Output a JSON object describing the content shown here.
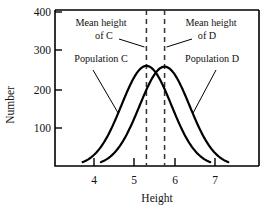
{
  "chart_data": {
    "type": "line",
    "title": "",
    "xlabel": "Height",
    "ylabel": "Number",
    "xlim": [
      3.3,
      7.6
    ],
    "ylim": [
      0,
      400
    ],
    "grid": false,
    "legend": "none",
    "x_ticks": [
      "4",
      "5",
      "6",
      "7"
    ],
    "x_tick_values": [
      4,
      5,
      6,
      7
    ],
    "y_ticks": [
      "100",
      "200",
      "300",
      "400"
    ],
    "y_tick_values": [
      100,
      200,
      300,
      400
    ],
    "series": [
      {
        "name": "Population C",
        "mean": 5.3,
        "sd": 0.62,
        "peak": 260,
        "x": [
          3.7,
          3.9,
          4.1,
          4.3,
          4.5,
          4.7,
          4.9,
          5.1,
          5.3,
          5.5,
          5.7,
          5.9,
          6.1,
          6.3,
          6.5,
          6.7,
          6.9
        ],
        "values": [
          4,
          10,
          24,
          48,
          85,
          132,
          183,
          229,
          258,
          251,
          215,
          166,
          115,
          70,
          38,
          18,
          7
        ]
      },
      {
        "name": "Population D",
        "mean": 5.75,
        "sd": 0.62,
        "peak": 258,
        "x": [
          4.15,
          4.35,
          4.55,
          4.75,
          4.95,
          5.15,
          5.35,
          5.55,
          5.75,
          5.95,
          6.15,
          6.35,
          6.55,
          6.75,
          6.95,
          7.15,
          7.35
        ],
        "values": [
          4,
          10,
          24,
          48,
          85,
          132,
          183,
          229,
          256,
          249,
          213,
          164,
          114,
          69,
          37,
          17,
          7
        ]
      }
    ],
    "annotations": [
      {
        "id": "mean-c",
        "line1": "Mean height",
        "line2": "of C",
        "points_to_x": 5.3,
        "kind": "mean-marker"
      },
      {
        "id": "mean-d",
        "line1": "Mean height",
        "line2": "of D",
        "points_to_x": 5.75,
        "kind": "mean-marker"
      },
      {
        "id": "population-c",
        "line1": "Population C",
        "line2": "",
        "points_to_x": 4.6,
        "kind": "curve-label"
      },
      {
        "id": "population-d",
        "line1": "Population D",
        "line2": "",
        "points_to_x": 6.45,
        "kind": "curve-label"
      }
    ],
    "mean_lines": [
      {
        "name": "Mean height of C",
        "value": 5.3
      },
      {
        "name": "Mean height of D",
        "value": 5.75
      }
    ],
    "colors": {
      "curve": "#000000",
      "axis": "#000000",
      "mean_line": "#333333",
      "background": "#ffffff"
    }
  },
  "axes": {
    "x_title": "Height",
    "y_title": "Number"
  },
  "labels": {
    "mean_c_line1": "Mean height",
    "mean_c_line2": "of C",
    "mean_d_line1": "Mean height",
    "mean_d_line2": "of D",
    "population_c": "Population C",
    "population_d": "Population D"
  },
  "y_tick_labels": {
    "t400": "400",
    "t300": "300",
    "t200": "200",
    "t100": "100"
  },
  "x_tick_labels": {
    "t4": "4",
    "t5": "5",
    "t6": "6",
    "t7": "7"
  }
}
